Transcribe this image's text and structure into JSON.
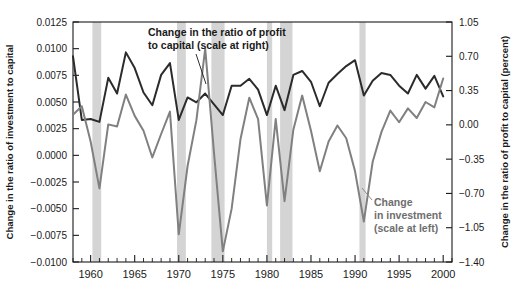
{
  "chart_data": {
    "type": "line",
    "title": "",
    "xlabel": "",
    "ylabel": "Change in the ratio of investment to capital",
    "ylabel_right": "Change in the ratio of profit to capital (percent)",
    "grid": false,
    "legend_position": "inline-annotations",
    "xlim": [
      1958,
      2001
    ],
    "ylim": [
      -0.01,
      0.0125
    ],
    "ylim_right": [
      -1.4,
      1.05
    ],
    "x_ticks_major": [
      1960,
      1965,
      1970,
      1975,
      1980,
      1985,
      1990,
      1995,
      2000
    ],
    "x_tick_labels": [
      "1960",
      "1965",
      "1970",
      "1975",
      "1980",
      "1985",
      "1990",
      "1995",
      "2000"
    ],
    "x_ticks_minor_step": 1,
    "y_ticks_left": [
      0.0125,
      0.01,
      0.0075,
      0.005,
      0.0025,
      0.0,
      -0.0025,
      -0.005,
      -0.0075,
      -0.01
    ],
    "y_tick_labels_left": [
      "0.0125",
      "0.0100",
      "0.0075",
      "0.0050",
      "0.0025",
      "0.0000",
      "−0.0025",
      "−0.0050",
      "−0.0075",
      "−0.0100"
    ],
    "y_ticks_right": [
      1.05,
      0.7,
      0.35,
      0.0,
      -0.35,
      -0.7,
      -1.05,
      -1.4
    ],
    "y_tick_labels_right": [
      "1.05",
      "0.70",
      "0.35",
      "0.00",
      "−0.35",
      "−0.70",
      "−1.05",
      "−1.40"
    ],
    "colors": {
      "profit": "#2b2b2b",
      "investment": "#808080",
      "recession_band": "#d4d4d4",
      "axis": "#1a1a1a"
    },
    "annotations": [
      {
        "name": "profit-series-annotation",
        "text_lines": [
          "Change in the ratio of profit",
          "to capital (scale at right)"
        ],
        "color": "#1a1a1a"
      },
      {
        "name": "investment-series-annotation",
        "text_lines": [
          "Change",
          "in investment",
          "(scale at left)"
        ],
        "color": "#6e6e6e"
      }
    ],
    "recession_bands": [
      {
        "start": 1960.2,
        "end": 1961.2
      },
      {
        "start": 1969.8,
        "end": 1970.8
      },
      {
        "start": 1973.7,
        "end": 1975.2
      },
      {
        "start": 1980.0,
        "end": 1980.6
      },
      {
        "start": 1981.5,
        "end": 1982.9
      },
      {
        "start": 1990.5,
        "end": 1991.2
      }
    ],
    "series": [
      {
        "name": "Change in the ratio of profit to capital (percent)",
        "axis": "right",
        "color": "#2b2b2b",
        "x": [
          1958,
          1959,
          1960,
          1961,
          1962,
          1963,
          1964,
          1965,
          1966,
          1967,
          1968,
          1969,
          1970,
          1971,
          1972,
          1973,
          1974,
          1975,
          1976,
          1977,
          1978,
          1979,
          1980,
          1981,
          1982,
          1983,
          1984,
          1985,
          1986,
          1987,
          1988,
          1989,
          1990,
          1991,
          1992,
          1993,
          1994,
          1995,
          1996,
          1997,
          1998,
          1999,
          2000
        ],
        "values": [
          0.7,
          0.05,
          0.06,
          0.03,
          0.48,
          0.32,
          0.74,
          0.58,
          0.33,
          0.2,
          0.51,
          0.63,
          0.05,
          0.28,
          0.23,
          0.32,
          0.21,
          0.1,
          0.4,
          0.4,
          0.47,
          0.36,
          0.1,
          0.4,
          0.15,
          0.51,
          0.55,
          0.44,
          0.19,
          0.43,
          0.52,
          0.6,
          0.66,
          0.3,
          0.45,
          0.53,
          0.51,
          0.4,
          0.32,
          0.51,
          0.37,
          0.5,
          0.29
        ],
        "label": "Change in the ratio of profit to capital (scale at right)"
      },
      {
        "name": "Change in the ratio of investment to capital",
        "axis": "left",
        "color": "#808080",
        "x": [
          1958,
          1959,
          1960,
          1961,
          1962,
          1963,
          1964,
          1965,
          1966,
          1967,
          1968,
          1969,
          1970,
          1971,
          1972,
          1973,
          1974,
          1975,
          1976,
          1977,
          1978,
          1979,
          1980,
          1981,
          1982,
          1983,
          1984,
          1985,
          1986,
          1987,
          1988,
          1989,
          1990,
          1991,
          1992,
          1993,
          1994,
          1995,
          1996,
          1997,
          1998,
          1999,
          2000
        ],
        "values": [
          0.0038,
          0.0046,
          0.0013,
          -0.0031,
          0.0029,
          0.0027,
          0.0057,
          0.0037,
          0.0023,
          -0.0002,
          0.002,
          0.0041,
          -0.0074,
          -0.001,
          0.0033,
          0.01,
          0.0002,
          -0.009,
          -0.005,
          0.0015,
          0.0054,
          0.0034,
          -0.0047,
          0.0034,
          -0.0043,
          0.0024,
          0.0056,
          0.0023,
          -0.0015,
          0.0013,
          0.0028,
          0.0016,
          -0.0015,
          -0.0062,
          -0.0006,
          0.0022,
          0.0042,
          0.0031,
          0.0044,
          0.0035,
          0.005,
          0.0045,
          0.0072
        ],
        "label": "Change in investment (scale at left)"
      }
    ]
  },
  "layout": {
    "plot_left_px": 73,
    "plot_right_px": 452,
    "plot_top_px": 22,
    "plot_bottom_px": 262
  }
}
